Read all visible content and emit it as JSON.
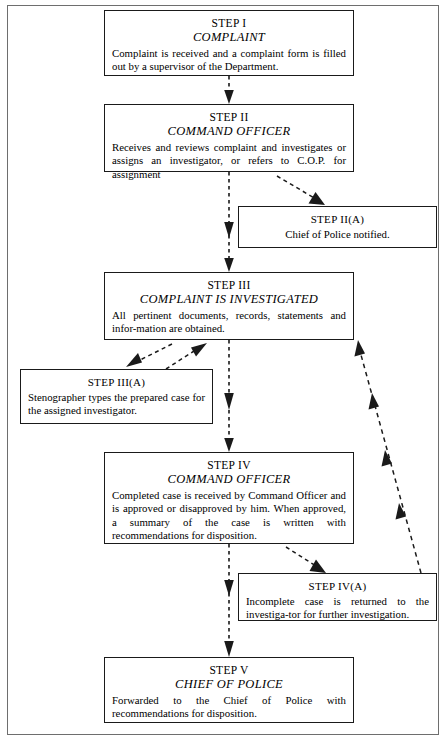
{
  "diagram": {
    "background_color": "#ffffff",
    "frame_color": "#6e6e6e",
    "box_border_color": "#1a1a1a",
    "connector_color": "#1a1a1a",
    "connector_style": "dashed-with-solid-arrowheads"
  },
  "nodes": [
    {
      "id": "step-1",
      "step": "STEP I",
      "role": "COMPLAINT",
      "body": "Complaint is received and a complaint form is filled out by a supervisor of the Department."
    },
    {
      "id": "step-2",
      "step": "STEP II",
      "role": "COMMAND OFFICER",
      "body": "Receives and reviews complaint and investigates or assigns an investigator, or refers to C.O.P. for assignment"
    },
    {
      "id": "step-2a",
      "step": "STEP II(A)",
      "role": "",
      "body": "Chief of Police notified."
    },
    {
      "id": "step-3",
      "step": "STEP III",
      "role": "COMPLAINT IS INVESTIGATED",
      "body": "All pertinent documents, records, statements and infor-mation are obtained."
    },
    {
      "id": "step-3a",
      "step": "STEP III(A)",
      "role": "",
      "body": "Stenographer types the prepared case for the assigned investigator."
    },
    {
      "id": "step-4",
      "step": "STEP IV",
      "role": "COMMAND OFFICER",
      "body": "Completed case is received by Command Officer and is approved or disapproved by him. When approved, a summary of the case is written with recommendations for disposition."
    },
    {
      "id": "step-4a",
      "step": "STEP IV(A)",
      "role": "",
      "body": "Incomplete case is returned to the investiga-tor for further investigation."
    },
    {
      "id": "step-5",
      "step": "STEP V",
      "role": "CHIEF OF POLICE",
      "body": "Forwarded to the Chief of Police with recommendations for disposition."
    }
  ],
  "connectors": [
    {
      "id": "c1",
      "from": "step-1",
      "to": "step-2",
      "kind": "vertical-dashed-arrow"
    },
    {
      "id": "c2",
      "from": "step-2",
      "to": "step-2a",
      "kind": "diagonal-dashed-arrow"
    },
    {
      "id": "c3",
      "from": "step-2",
      "to": "step-3",
      "kind": "vertical-dashed-arrow"
    },
    {
      "id": "c4",
      "from": "step-3",
      "to": "step-3a",
      "kind": "diagonal-dashed-arrow"
    },
    {
      "id": "c5",
      "from": "step-3a",
      "to": "step-3",
      "kind": "diagonal-dashed-arrow"
    },
    {
      "id": "c6",
      "from": "step-3",
      "to": "step-4",
      "kind": "vertical-dashed-arrow"
    },
    {
      "id": "c7",
      "from": "step-4",
      "to": "step-4a",
      "kind": "diagonal-dashed-arrow"
    },
    {
      "id": "c8",
      "from": "step-4",
      "to": "step-5",
      "kind": "vertical-dashed-arrow"
    },
    {
      "id": "c9",
      "from": "step-4a",
      "to": "step-3",
      "kind": "long-diagonal-dashed-return-arrow"
    }
  ]
}
